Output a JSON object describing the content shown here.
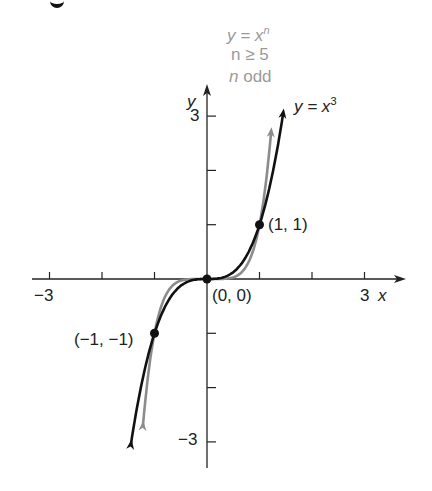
{
  "chart_data": {
    "type": "line",
    "title": "",
    "xlabel": "x",
    "ylabel": "y",
    "xlim": [
      -3,
      3
    ],
    "ylim": [
      -3,
      3
    ],
    "x_ticks": [
      -3,
      -2,
      -1,
      0,
      1,
      2,
      3
    ],
    "y_ticks": [
      -3,
      -2,
      -1,
      1,
      2,
      3
    ],
    "x_tick_labels": {
      "-3": "−3",
      "3": "3"
    },
    "y_tick_labels": {
      "3": "3",
      "-3": "−3"
    },
    "grid": false,
    "series": [
      {
        "name": "y = x^3",
        "color": "#111111",
        "function": "x^3",
        "x_range": [
          -1.45,
          1.45
        ]
      },
      {
        "name": "y = x^n, n ≥ 5, n odd",
        "color": "#8c8c8c",
        "function": "x^5",
        "x_range": [
          -1.22,
          1.22
        ]
      }
    ],
    "points": [
      {
        "x": -1,
        "y": -1,
        "label": "(−1, −1)"
      },
      {
        "x": 0,
        "y": 0,
        "label": "(0, 0)"
      },
      {
        "x": 1,
        "y": 1,
        "label": "(1, 1)"
      }
    ],
    "annotations": {
      "gray_label": [
        "y = x^n",
        "n ≥ 5",
        "n odd"
      ],
      "black_label": "y = x^3"
    }
  },
  "labels": {
    "x_axis": "x",
    "y_axis": "y",
    "tick_x_min": "−3",
    "tick_x_max": "3",
    "tick_y_max": "3",
    "tick_y_min": "−3",
    "gray_line1_lhs": "y = x",
    "gray_line1_exp": "n",
    "gray_line2": "n ≥ 5",
    "gray_line3_n": "n",
    "gray_line3_rest": " odd",
    "black_lhs": "y = x",
    "black_exp": "3",
    "pt_neg": "(−1, −1)",
    "pt_origin": "(0, 0)",
    "pt_pos": "(1, 1)"
  }
}
